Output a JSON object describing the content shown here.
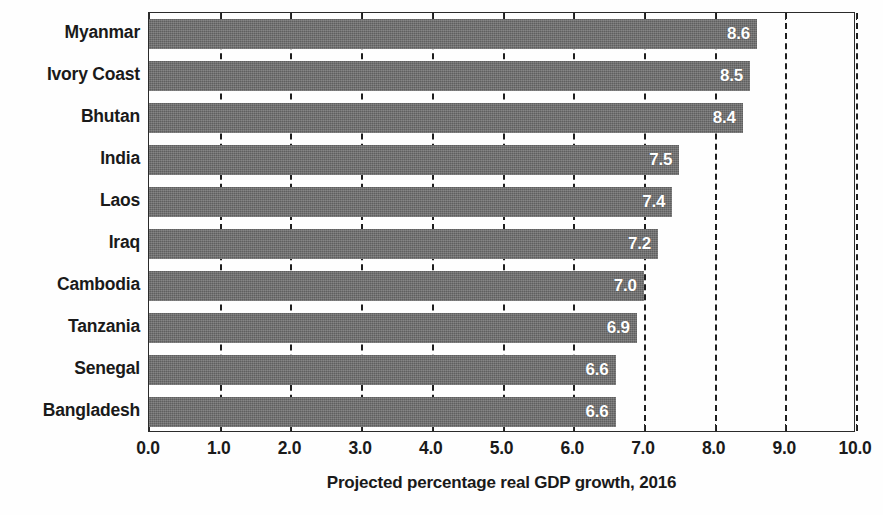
{
  "chart_data": {
    "type": "bar",
    "orientation": "horizontal",
    "title": "",
    "xlabel": "Projected percentage real GDP growth, 2016",
    "ylabel": "",
    "xlim": [
      0.0,
      10.0
    ],
    "xticks": [
      "0.0",
      "1.0",
      "2.0",
      "3.0",
      "4.0",
      "5.0",
      "6.0",
      "7.0",
      "8.0",
      "9.0",
      "10.0"
    ],
    "xtick_values": [
      0.0,
      1.0,
      2.0,
      3.0,
      4.0,
      5.0,
      6.0,
      7.0,
      8.0,
      9.0,
      10.0
    ],
    "grid": true,
    "grid_axis": "x",
    "grid_style": "dashed",
    "legend": false,
    "categories": [
      "Myanmar",
      "Ivory Coast",
      "Bhutan",
      "India",
      "Laos",
      "Iraq",
      "Cambodia",
      "Tanzania",
      "Senegal",
      "Bangladesh"
    ],
    "values": [
      8.6,
      8.5,
      8.4,
      7.5,
      7.4,
      7.2,
      7.0,
      6.9,
      6.6,
      6.6
    ],
    "data_labels": [
      "8.6",
      "8.5",
      "8.4",
      "7.5",
      "7.4",
      "7.2",
      "7.0",
      "6.9",
      "6.6",
      "6.6"
    ],
    "bars": [
      {
        "category": "Myanmar",
        "value": 8.6,
        "label": "8.6"
      },
      {
        "category": "Ivory Coast",
        "value": 8.5,
        "label": "8.5"
      },
      {
        "category": "Bhutan",
        "value": 8.4,
        "label": "8.4"
      },
      {
        "category": "India",
        "value": 7.5,
        "label": "7.5"
      },
      {
        "category": "Laos",
        "value": 7.4,
        "label": "7.4"
      },
      {
        "category": "Iraq",
        "value": 7.2,
        "label": "7.2"
      },
      {
        "category": "Cambodia",
        "value": 7.0,
        "label": "7.0"
      },
      {
        "category": "Tanzania",
        "value": 6.9,
        "label": "6.9"
      },
      {
        "category": "Senegal",
        "value": 6.6,
        "label": "6.6"
      },
      {
        "category": "Bangladesh",
        "value": 6.6,
        "label": "6.6"
      }
    ],
    "colors": {
      "bar": "#6a6a6a",
      "data_label": "#ffffff",
      "axis": "#2b2b2b",
      "gridline": "#1e1e1e",
      "text": "#1a1a1a",
      "background": "#fefefe"
    }
  }
}
